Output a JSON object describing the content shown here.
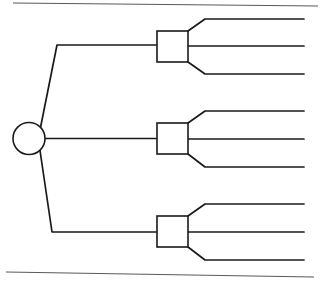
{
  "canvas": {
    "width": 321,
    "height": 286,
    "background": "#ffffff"
  },
  "style": {
    "stroke": "#1a1a1a",
    "stroke_light": "#5a5a5a",
    "fill": "none",
    "line_width": 1.6,
    "border_line_width": 1.2
  },
  "diagram": {
    "type": "fan-out-tree",
    "title": "",
    "source_node": {
      "label": "",
      "shape": "circle",
      "cx": 29,
      "cy": 138.5,
      "r": 16
    },
    "branch_nodes": [
      {
        "label": "",
        "shape": "rect",
        "x": 157,
        "y": 31,
        "width": 31,
        "height": 31,
        "stem_bend_x": 57,
        "stem_y": 45
      },
      {
        "label": "",
        "shape": "rect",
        "x": 157,
        "y": 123,
        "width": 31,
        "height": 31,
        "stem_bend_x": 0,
        "stem_y": 138.5
      },
      {
        "label": "",
        "shape": "rect",
        "x": 157,
        "y": 216,
        "width": 31,
        "height": 31,
        "stem_bend_x": 52,
        "stem_y": 232
      }
    ],
    "output_lines": [
      {
        "group": 1,
        "index": 0,
        "y": 19,
        "bend_x": 205,
        "end_x": 304,
        "from": "top-right"
      },
      {
        "group": 1,
        "index": 1,
        "y": 46,
        "bend_x": 188,
        "end_x": 304,
        "from": "mid-right"
      },
      {
        "group": 1,
        "index": 2,
        "y": 74,
        "bend_x": 205,
        "end_x": 304,
        "from": "bottom-right"
      },
      {
        "group": 2,
        "index": 0,
        "y": 111,
        "bend_x": 205,
        "end_x": 304,
        "from": "top-right"
      },
      {
        "group": 2,
        "index": 1,
        "y": 139,
        "bend_x": 188,
        "end_x": 304,
        "from": "mid-right"
      },
      {
        "group": 2,
        "index": 2,
        "y": 167,
        "bend_x": 205,
        "end_x": 304,
        "from": "bottom-right"
      },
      {
        "group": 3,
        "index": 0,
        "y": 204,
        "bend_x": 205,
        "end_x": 304,
        "from": "top-right"
      },
      {
        "group": 3,
        "index": 1,
        "y": 232,
        "bend_x": 188,
        "end_x": 304,
        "from": "mid-right"
      },
      {
        "group": 3,
        "index": 2,
        "y": 260,
        "bend_x": 205,
        "end_x": 304,
        "from": "bottom-right"
      }
    ],
    "frame_lines": [
      {
        "name": "top-rule",
        "x1": 13,
        "y1": 3,
        "x2": 318,
        "y2": 6
      },
      {
        "name": "bottom-rule",
        "x1": 6,
        "y1": 272,
        "x2": 314,
        "y2": 277
      }
    ]
  }
}
